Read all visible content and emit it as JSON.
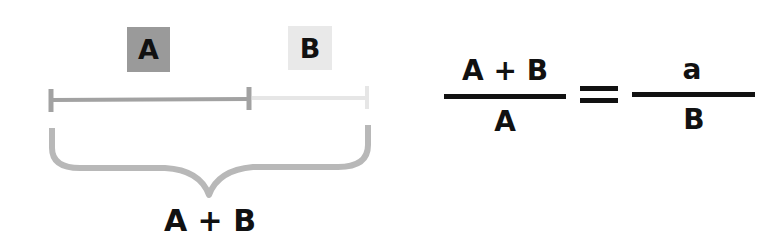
{
  "diagram": {
    "segment_labels": {
      "a": "A",
      "b": "B"
    },
    "brace_label": "A + B",
    "equation": {
      "left_numerator": "A + B",
      "left_denominator": "A",
      "equals": "=",
      "right_numerator": "a",
      "right_denominator": "B"
    },
    "colors": {
      "box_a": "#9a9a9a",
      "box_b": "#e9e9e9",
      "segment_a": "#a2a2a2",
      "segment_b": "#e6e6e6",
      "brace": "#b8b8b8",
      "text": "#111111"
    }
  }
}
